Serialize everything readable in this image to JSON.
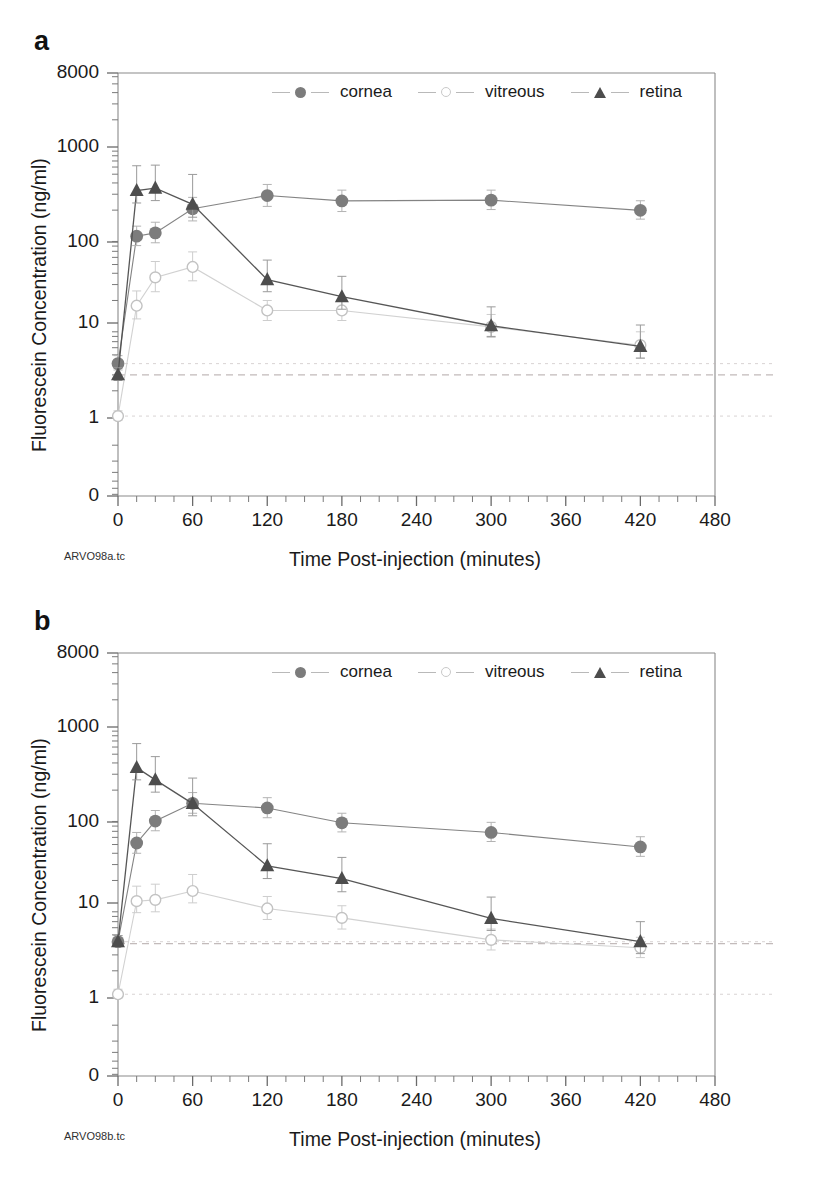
{
  "figure": {
    "panels": [
      {
        "letter": "a",
        "file_caption": "ARVO98a.tc",
        "chart_ref": 0
      },
      {
        "letter": "b",
        "file_caption": "ARVO98b.tc",
        "chart_ref": 1
      }
    ]
  },
  "chart_data": [
    {
      "type": "line",
      "panel": "a",
      "title": "",
      "xlabel": "Time Post-injection (minutes)",
      "ylabel": "Fluorescein Concentration (ng/ml)",
      "xlim": [
        0,
        480
      ],
      "xticks": [
        0,
        60,
        120,
        180,
        240,
        300,
        360,
        420,
        480
      ],
      "xticklabels": [
        "0",
        "60",
        "120",
        "180",
        "240",
        "300",
        "360",
        "420",
        "480"
      ],
      "yscale": "log",
      "ylim": [
        1,
        8000
      ],
      "yticks": [
        0,
        1,
        10,
        100,
        1000,
        8000
      ],
      "yticklabels": [
        "0",
        "1",
        "10",
        "100",
        "1000",
        "8000"
      ],
      "grid": false,
      "legend_position": "upper-center-inside",
      "x": [
        0,
        15,
        30,
        60,
        120,
        180,
        300,
        420
      ],
      "series": [
        {
          "name": "cornea",
          "marker": "filled-circle",
          "color": "#7c7c7c",
          "values": [
            4.0,
            103,
            112,
            207,
            290,
            253,
            258,
            199
          ],
          "err_low": [
            0.6,
            22,
            25,
            55,
            70,
            60,
            55,
            40
          ],
          "err_high": [
            0.9,
            30,
            35,
            70,
            95,
            80,
            75,
            55
          ]
        },
        {
          "name": "vitreous",
          "marker": "open-circle",
          "color": "#c9c9c9",
          "values": [
            1.05,
            17.5,
            36,
            47,
            15.5,
            15.5,
            10.2,
            6.4
          ],
          "err_low": [
            0.1,
            5,
            11,
            14,
            3.5,
            3.5,
            2.4,
            1.8
          ],
          "err_high": [
            0.15,
            8,
            18,
            22,
            4.5,
            5.0,
            3.8,
            2.6
          ]
        },
        {
          "name": "retina",
          "marker": "filled-triangle",
          "color": "#4d4d4d",
          "values": [
            3.0,
            330,
            350,
            232,
            34,
            22,
            10.5,
            6.2
          ],
          "err_low": [
            0.4,
            90,
            95,
            65,
            9,
            6,
            2.5,
            1.6
          ],
          "err_high": [
            0.6,
            290,
            280,
            265,
            22,
            15,
            6.5,
            4.5
          ]
        }
      ],
      "reference_lines": [
        4.0,
        3.0,
        1.05
      ]
    },
    {
      "type": "line",
      "panel": "b",
      "title": "",
      "xlabel": "Time Post-injection (minutes)",
      "ylabel": "Fluorescein Concentration (ng/ml)",
      "xlim": [
        0,
        480
      ],
      "xticks": [
        0,
        60,
        120,
        180,
        240,
        300,
        360,
        420,
        480
      ],
      "xticklabels": [
        "0",
        "60",
        "120",
        "180",
        "240",
        "300",
        "360",
        "420",
        "480"
      ],
      "yscale": "log",
      "ylim": [
        1,
        8000
      ],
      "yticks": [
        0,
        1,
        10,
        100,
        1000,
        8000
      ],
      "yticklabels": [
        "0",
        "1",
        "10",
        "100",
        "1000",
        "8000"
      ],
      "grid": false,
      "legend_position": "upper-center-inside",
      "x": [
        0,
        15,
        30,
        60,
        120,
        180,
        300,
        420
      ],
      "series": [
        {
          "name": "cornea",
          "marker": "filled-circle",
          "color": "#7c7c7c",
          "values": [
            4.2,
            52,
            91,
            143,
            127,
            87,
            68,
            47
          ],
          "err_low": [
            0.5,
            12,
            20,
            32,
            28,
            18,
            14,
            10
          ],
          "err_high": [
            0.7,
            16,
            28,
            45,
            38,
            24,
            20,
            14
          ]
        },
        {
          "name": "vitreous",
          "marker": "open-circle",
          "color": "#c9c9c9",
          "values": [
            1.1,
            11.8,
            12.2,
            15.3,
            9.8,
            7.7,
            4.4,
            3.6
          ],
          "err_low": [
            0.1,
            3.0,
            3.2,
            4.0,
            2.4,
            1.9,
            1.0,
            0.8
          ],
          "err_high": [
            0.15,
            5.5,
            6.0,
            8.0,
            3.5,
            2.8,
            1.4,
            1.1
          ]
        },
        {
          "name": "retina",
          "marker": "filled-triangle",
          "color": "#4d4d4d",
          "values": [
            4.2,
            355,
            260,
            142,
            29,
            21,
            7.6,
            4.2
          ],
          "err_low": [
            0.5,
            95,
            70,
            38,
            8,
            6,
            2.0,
            1.1
          ],
          "err_high": [
            0.7,
            300,
            210,
            130,
            22,
            15,
            5.5,
            2.8
          ]
        }
      ],
      "reference_lines": [
        4.2,
        4.0,
        1.1
      ]
    }
  ],
  "legend": {
    "entries": [
      {
        "label": "cornea",
        "marker": "filled-circle"
      },
      {
        "label": "vitreous",
        "marker": "open-circle"
      },
      {
        "label": "retina",
        "marker": "filled-triangle"
      }
    ]
  },
  "colors": {
    "cornea": "#7c7c7c",
    "vitreous": "#c9c9c9",
    "retina": "#4d4d4d",
    "axis": "#555555",
    "reference_line": "#c0b8b8"
  }
}
